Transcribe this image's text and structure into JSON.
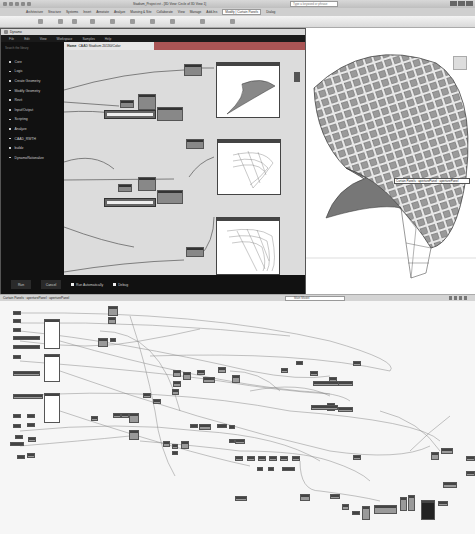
{
  "revit": {
    "title": "Stadium_Project.rvt - [3D View: Circle of 3D View 1]",
    "search_placeholder": "Type a keyword or phrase",
    "ribbon_tabs": [
      "Architecture",
      "Structure",
      "Systems",
      "Insert",
      "Annotate",
      "Analyze",
      "Massing & Site",
      "Collaborate",
      "View",
      "Manage",
      "Add-Ins",
      "Modify | Curtain Panels",
      "Dialog"
    ],
    "active_tab": "Modify | Curtain Panels",
    "tooltip": "Curtain Panels : aperturePanel : aperturePanel"
  },
  "dynamo": {
    "title": "Dynamo",
    "menu": [
      "File",
      "Edit",
      "View",
      "Workspace",
      "Samples",
      "Help"
    ],
    "library_search": "Search the library",
    "library": [
      "Core",
      "Logic",
      "Create Geometry",
      "Modify Geometry",
      "Revit",
      "Input/Output",
      "Scripting",
      "Analyze",
      "CAAD_RWTH",
      "buildz",
      "DynamoRationalize"
    ],
    "tab_home": "Home",
    "tab_file": "CAAD Stadium 20130/Color",
    "run_label": "Run",
    "cancel_label": "Cancel",
    "run_auto_label": "Run Automatically",
    "debug_label": "Debug"
  },
  "statusbar": {
    "text": "Curtain Panels : aperturePanel : aperturePanel",
    "model": "Main Model"
  },
  "colors": {
    "dynamo_bg": "#111111",
    "canvas_bg": "#dcdcdc",
    "node": "#888888",
    "tab_accent": "#aa5555"
  }
}
